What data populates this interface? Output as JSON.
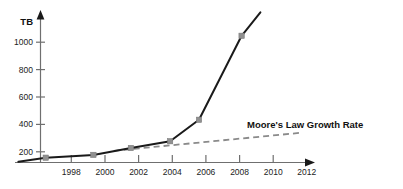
{
  "chart_data": {
    "type": "line",
    "title": "",
    "xlabel": "",
    "ylabel": "TB",
    "xlim": [
      1996.2,
      2013.6
    ],
    "ylim": [
      0,
      1100
    ],
    "grid": false,
    "legend_position": "inline-annotation",
    "xticks": [
      "1998",
      "2000",
      "2002",
      "2004",
      "2006",
      "2008",
      "2010",
      "2012"
    ],
    "xtick_values": [
      1998,
      2000,
      2002,
      2004,
      2006,
      2008,
      2010,
      2012
    ],
    "yticks": [
      "200",
      "400",
      "600",
      "800",
      "1000"
    ],
    "ytick_values": [
      200,
      400,
      600,
      800,
      1000
    ],
    "series": [
      {
        "name": "Data Growth",
        "style": "solid",
        "color": "#1a1a1a",
        "marker": "square",
        "marker_color": "#909090",
        "x": [
          1996.4,
          1998.0,
          2000.8,
          2003.0,
          2005.3,
          2007.0,
          2009.5,
          2010.6
        ],
        "values": [
          5,
          35,
          55,
          105,
          155,
          310,
          920,
          1090
        ]
      },
      {
        "name": "Moore's Law Growth Rate",
        "style": "dashed",
        "color": "#8a8a8a",
        "marker": "none",
        "x": [
          2002.0,
          2012.9
        ],
        "values": [
          85,
          215
        ]
      }
    ],
    "annotations": [
      {
        "name": "moore-law-annotation",
        "text": "Moore's Law Growth Rate",
        "x": 2009.5,
        "y": 330
      }
    ]
  },
  "axis": {
    "y_unit_label": "TB"
  }
}
